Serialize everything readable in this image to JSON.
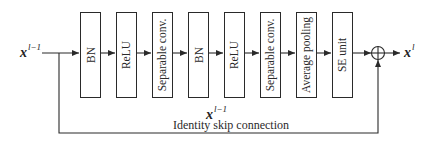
{
  "diagram": {
    "input_label": {
      "base": "x",
      "sup": "l−1"
    },
    "output_label": {
      "base": "x",
      "sup": "l"
    },
    "mid_label": {
      "base": "x",
      "sup": "l−1"
    },
    "skip_caption": "Identity skip connection",
    "blocks": [
      {
        "label": "BN"
      },
      {
        "label": "ReLU"
      },
      {
        "label": "Separable conv."
      },
      {
        "label": "BN"
      },
      {
        "label": "ReLU"
      },
      {
        "label": "Separable conv."
      },
      {
        "label": "Average pooling"
      },
      {
        "label": "SE unit"
      }
    ],
    "sum_node": "⊕",
    "line_color": "#2a2a2a"
  }
}
